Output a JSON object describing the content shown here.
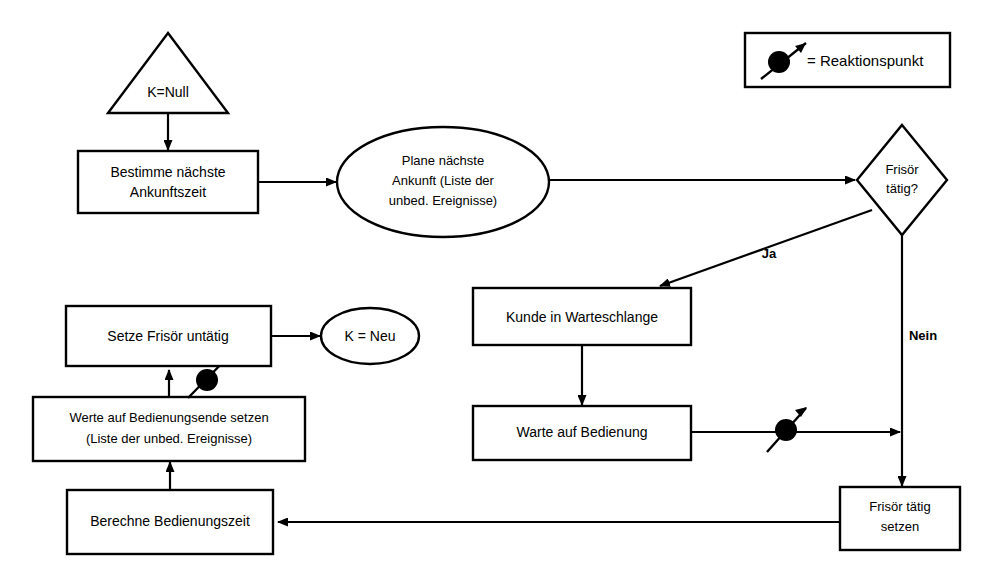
{
  "diagram": {
    "legend": {
      "marker_name": "reaktionspunkt-marker",
      "label": "= Reaktionspunkt"
    },
    "nodes": {
      "start_trigger": {
        "shape": "triangle",
        "label": "K=Null"
      },
      "bestimme": {
        "shape": "rect",
        "line1": "Bestimme nächste",
        "line2": "Ankunftszeit"
      },
      "plane": {
        "shape": "ellipse",
        "line1": "Plane nächste",
        "line2": "Ankunft (Liste der",
        "line3": "unbed. Ereignisse)"
      },
      "decision": {
        "shape": "diamond",
        "line1": "Frisör",
        "line2": "tätig?"
      },
      "kunde": {
        "shape": "rect",
        "label": "Kunde in Warteschlange"
      },
      "warte": {
        "shape": "rect",
        "label": "Warte auf Bedienung"
      },
      "frisoer_taetig": {
        "shape": "rect",
        "line1": "Frisör tätig",
        "line2": "setzen"
      },
      "berechne": {
        "shape": "rect",
        "label": "Berechne Bedienungszeit"
      },
      "werte": {
        "shape": "rect",
        "line1": "Werte auf Bedienungsende setzen",
        "line2": "(Liste der unbed. Ereignisse)"
      },
      "setze_untaetig": {
        "shape": "rect",
        "label": "Setze Frisör untätig"
      },
      "k_neu": {
        "shape": "ellipse",
        "label": "K = Neu"
      }
    },
    "edge_labels": {
      "ja": "Ja",
      "nein": "Nein"
    },
    "colors": {
      "stroke": "#000000",
      "fill": "#ffffff",
      "marker": "#000000"
    }
  }
}
